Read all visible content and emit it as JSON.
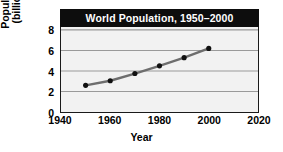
{
  "chart_data": {
    "type": "line",
    "title": "World Population, 1950–2000",
    "xlabel": "Year",
    "ylabel_line1": "Population",
    "ylabel_line2": "(billions)",
    "ylabel": "Population (billions)",
    "x": [
      1950,
      1960,
      1970,
      1980,
      1990,
      2000
    ],
    "values": [
      2.6,
      3.05,
      3.75,
      4.5,
      5.3,
      6.2
    ],
    "series": [
      {
        "name": "World population",
        "values": [
          2.6,
          3.05,
          3.75,
          4.5,
          5.3,
          6.2
        ]
      }
    ],
    "xlim": [
      1940,
      2020
    ],
    "ylim": [
      0,
      8
    ],
    "xticks": [
      "1940",
      "1960",
      "1980",
      "2000",
      "2020"
    ],
    "xtick_values": [
      1940,
      1960,
      1980,
      2000,
      2020
    ],
    "yticks": [
      "0",
      "2",
      "4",
      "6",
      "8"
    ],
    "ytick_values": [
      0,
      2,
      4,
      6,
      8
    ],
    "grid": "horizontal",
    "legend": "none",
    "line_color": "#6e6e6e",
    "marker_color": "#111111",
    "plot_background": "#f2f2f2",
    "gridline_color": "#9a9a9a",
    "axis_color": "#1a1a1a",
    "title_background": "#0d0d0d",
    "title_color": "#ffffff"
  }
}
